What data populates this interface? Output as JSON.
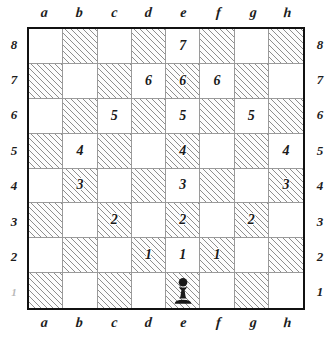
{
  "board": {
    "files_top": [
      "a",
      "b",
      "c",
      "d",
      "e",
      "f",
      "g",
      "h"
    ],
    "files_bottom": [
      "a",
      "b",
      "c",
      "d",
      "e",
      "f",
      "g",
      "h"
    ],
    "ranks_left": [
      "8",
      "7",
      "6",
      "5",
      "4",
      "3",
      "2",
      "1"
    ],
    "ranks_right": [
      "8",
      "7",
      "6",
      "5",
      "4",
      "3",
      "2",
      "1"
    ],
    "border_color": "#111111",
    "grid_line_color": "#9a9a9a",
    "light_square_color": "#ffffff",
    "dark_square_hatch_color": "#8e8e8e",
    "label_color": "#1c1c1c",
    "piece_color": "#1a1a1a",
    "squares": [
      {
        "id": "a8",
        "shade": "light",
        "label": "",
        "piece": ""
      },
      {
        "id": "b8",
        "shade": "dark",
        "label": "",
        "piece": ""
      },
      {
        "id": "c8",
        "shade": "light",
        "label": "",
        "piece": ""
      },
      {
        "id": "d8",
        "shade": "dark",
        "label": "",
        "piece": ""
      },
      {
        "id": "e8",
        "shade": "light",
        "label": "7",
        "piece": ""
      },
      {
        "id": "f8",
        "shade": "dark",
        "label": "",
        "piece": ""
      },
      {
        "id": "g8",
        "shade": "light",
        "label": "",
        "piece": ""
      },
      {
        "id": "h8",
        "shade": "dark",
        "label": "",
        "piece": ""
      },
      {
        "id": "a7",
        "shade": "dark",
        "label": "",
        "piece": ""
      },
      {
        "id": "b7",
        "shade": "light",
        "label": "",
        "piece": ""
      },
      {
        "id": "c7",
        "shade": "dark",
        "label": "",
        "piece": ""
      },
      {
        "id": "d7",
        "shade": "light",
        "label": "6",
        "piece": ""
      },
      {
        "id": "e7",
        "shade": "dark",
        "label": "6",
        "piece": ""
      },
      {
        "id": "f7",
        "shade": "light",
        "label": "6",
        "piece": ""
      },
      {
        "id": "g7",
        "shade": "dark",
        "label": "",
        "piece": ""
      },
      {
        "id": "h7",
        "shade": "light",
        "label": "",
        "piece": ""
      },
      {
        "id": "a6",
        "shade": "light",
        "label": "",
        "piece": ""
      },
      {
        "id": "b6",
        "shade": "dark",
        "label": "",
        "piece": ""
      },
      {
        "id": "c6",
        "shade": "light",
        "label": "5",
        "piece": ""
      },
      {
        "id": "d6",
        "shade": "dark",
        "label": "",
        "piece": ""
      },
      {
        "id": "e6",
        "shade": "light",
        "label": "5",
        "piece": ""
      },
      {
        "id": "f6",
        "shade": "dark",
        "label": "",
        "piece": ""
      },
      {
        "id": "g6",
        "shade": "light",
        "label": "5",
        "piece": ""
      },
      {
        "id": "h6",
        "shade": "dark",
        "label": "",
        "piece": ""
      },
      {
        "id": "a5",
        "shade": "dark",
        "label": "",
        "piece": ""
      },
      {
        "id": "b5",
        "shade": "light",
        "label": "4",
        "piece": ""
      },
      {
        "id": "c5",
        "shade": "dark",
        "label": "",
        "piece": ""
      },
      {
        "id": "d5",
        "shade": "light",
        "label": "",
        "piece": ""
      },
      {
        "id": "e5",
        "shade": "dark",
        "label": "4",
        "piece": ""
      },
      {
        "id": "f5",
        "shade": "light",
        "label": "",
        "piece": ""
      },
      {
        "id": "g5",
        "shade": "dark",
        "label": "",
        "piece": ""
      },
      {
        "id": "h5",
        "shade": "light",
        "label": "4",
        "piece": ""
      },
      {
        "id": "a4",
        "shade": "light",
        "label": "",
        "piece": ""
      },
      {
        "id": "b4",
        "shade": "dark",
        "label": "3",
        "piece": ""
      },
      {
        "id": "c4",
        "shade": "light",
        "label": "",
        "piece": ""
      },
      {
        "id": "d4",
        "shade": "dark",
        "label": "",
        "piece": ""
      },
      {
        "id": "e4",
        "shade": "light",
        "label": "3",
        "piece": ""
      },
      {
        "id": "f4",
        "shade": "dark",
        "label": "",
        "piece": ""
      },
      {
        "id": "g4",
        "shade": "light",
        "label": "",
        "piece": ""
      },
      {
        "id": "h4",
        "shade": "dark",
        "label": "3",
        "piece": ""
      },
      {
        "id": "a3",
        "shade": "dark",
        "label": "",
        "piece": ""
      },
      {
        "id": "b3",
        "shade": "light",
        "label": "",
        "piece": ""
      },
      {
        "id": "c3",
        "shade": "dark",
        "label": "2",
        "piece": ""
      },
      {
        "id": "d3",
        "shade": "light",
        "label": "",
        "piece": ""
      },
      {
        "id": "e3",
        "shade": "dark",
        "label": "2",
        "piece": ""
      },
      {
        "id": "f3",
        "shade": "light",
        "label": "",
        "piece": ""
      },
      {
        "id": "g3",
        "shade": "dark",
        "label": "2",
        "piece": ""
      },
      {
        "id": "h3",
        "shade": "light",
        "label": "",
        "piece": ""
      },
      {
        "id": "a2",
        "shade": "light",
        "label": "",
        "piece": ""
      },
      {
        "id": "b2",
        "shade": "dark",
        "label": "",
        "piece": ""
      },
      {
        "id": "c2",
        "shade": "light",
        "label": "",
        "piece": ""
      },
      {
        "id": "d2",
        "shade": "dark",
        "label": "1",
        "piece": ""
      },
      {
        "id": "e2",
        "shade": "light",
        "label": "1",
        "piece": ""
      },
      {
        "id": "f2",
        "shade": "dark",
        "label": "1",
        "piece": ""
      },
      {
        "id": "g2",
        "shade": "light",
        "label": "",
        "piece": ""
      },
      {
        "id": "h2",
        "shade": "dark",
        "label": "",
        "piece": ""
      },
      {
        "id": "a1",
        "shade": "dark",
        "label": "",
        "piece": ""
      },
      {
        "id": "b1",
        "shade": "light",
        "label": "",
        "piece": ""
      },
      {
        "id": "c1",
        "shade": "dark",
        "label": "",
        "piece": ""
      },
      {
        "id": "d1",
        "shade": "light",
        "label": "",
        "piece": ""
      },
      {
        "id": "e1",
        "shade": "dark",
        "label": "",
        "piece": "black-pawn"
      },
      {
        "id": "f1",
        "shade": "light",
        "label": "",
        "piece": ""
      },
      {
        "id": "g1",
        "shade": "dark",
        "label": "",
        "piece": ""
      },
      {
        "id": "h1",
        "shade": "light",
        "label": "",
        "piece": ""
      }
    ]
  }
}
